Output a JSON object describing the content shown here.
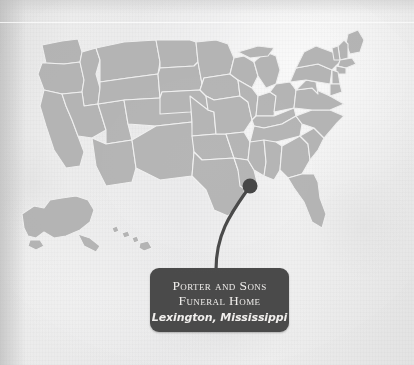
{
  "document": {
    "type": "scanned-page-map-figure",
    "background_color": "#eeeeee",
    "width": 414,
    "height": 365
  },
  "map": {
    "name": "united-states-map",
    "region": "United States of America",
    "state_fill_color": "#b6b6b6",
    "state_border_color": "#f1f1f1",
    "insets": [
      "Alaska",
      "Hawaii"
    ]
  },
  "marker": {
    "name": "location-marker",
    "color": "#474747",
    "state": "Mississippi",
    "x": 250,
    "y": 186
  },
  "leader_line": {
    "color": "#4a4a4a",
    "from_x": 250,
    "from_y": 186,
    "to_x": 216,
    "to_y": 268
  },
  "callout": {
    "background_color": "#4b4b4b",
    "text_color": "#f2f0ee",
    "title_line1": "Porter and Sons",
    "title_line2": "Funeral Home",
    "subtitle": "Lexington, Mississippi"
  }
}
